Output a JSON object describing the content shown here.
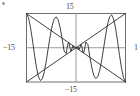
{
  "figure": {
    "name": "oscillating-function-plot",
    "corner_mark": "bullet-mark"
  },
  "axis_labels": {
    "top": "15",
    "bottom": "−15",
    "left": "−15",
    "right": "1"
  },
  "chart_data": {
    "type": "line",
    "title": "",
    "xlabel": "",
    "ylabel": "",
    "xlim": [
      -15,
      15
    ],
    "ylim": [
      -15,
      15
    ],
    "xticks": [
      -15,
      15
    ],
    "yticks": [
      -15,
      15
    ],
    "xtick_labels": [
      "−15",
      "1"
    ],
    "ytick_labels": [
      "15",
      "−15"
    ],
    "grid": false,
    "axes_through_origin": true,
    "frame": true,
    "legend": null,
    "line_color": "#2b2b2b",
    "axis_color": "#8c8c8c",
    "frame_color": "#6e6e6e",
    "background": "#ffffff",
    "envelopes": [
      {
        "name": "y = x",
        "points": [
          [
            -15,
            -15
          ],
          [
            15,
            15
          ]
        ]
      },
      {
        "name": "y = -x",
        "points": [
          [
            -15,
            15
          ],
          [
            15,
            -15
          ]
        ]
      }
    ],
    "series": [
      {
        "name": "x*sin(k/x)",
        "x": [
          -15.0,
          -14.4,
          -13.8,
          -13.2,
          -12.6,
          -12.0,
          -11.4,
          -10.8,
          -10.2,
          -9.6,
          -9.0,
          -8.4,
          -7.8,
          -7.2,
          -6.6,
          -6.0,
          -5.4,
          -4.8,
          -4.2,
          -3.6,
          -3.0,
          -2.7,
          -2.4,
          -2.1,
          -1.8,
          -1.5,
          -1.2,
          -0.9,
          -0.6,
          -0.3,
          0.0,
          0.3,
          0.6,
          0.9,
          1.2,
          1.5,
          1.8,
          2.1,
          2.4,
          2.7,
          3.0,
          3.6,
          4.2,
          4.8,
          5.4,
          6.0,
          6.6,
          7.2,
          7.8,
          8.4,
          9.0,
          9.6,
          10.2,
          10.8,
          11.4,
          12.0,
          12.6,
          13.2,
          13.8,
          14.4,
          15.0
        ],
        "y": [
          15.0,
          13.1,
          9.0,
          3.4,
          -2.8,
          -8.5,
          -12.6,
          -14.4,
          -13.6,
          -10.5,
          -5.7,
          -0.1,
          5.3,
          9.8,
          12.7,
          13.5,
          12.2,
          8.8,
          4.0,
          -1.4,
          -2.5,
          -0.3,
          2.0,
          2.0,
          -0.2,
          -1.5,
          -0.2,
          0.9,
          -0.3,
          0.2,
          0.0,
          -0.2,
          0.3,
          -0.9,
          0.2,
          1.5,
          0.2,
          -2.0,
          -2.0,
          0.3,
          2.5,
          1.4,
          -4.0,
          -8.8,
          -12.2,
          -13.5,
          -12.7,
          -9.8,
          -5.3,
          0.1,
          5.7,
          10.5,
          13.6,
          14.4,
          12.6,
          8.5,
          2.8,
          -3.4,
          -9.0,
          -13.1,
          -15.0
        ]
      }
    ]
  }
}
